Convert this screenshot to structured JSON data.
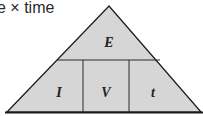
{
  "caption": "e × time",
  "diagram": {
    "type": "formula-triangle",
    "top": "E",
    "bottom": [
      "I",
      "V",
      "t"
    ],
    "fill": "#d6d6d6",
    "stroke": "#1a1a1a"
  }
}
